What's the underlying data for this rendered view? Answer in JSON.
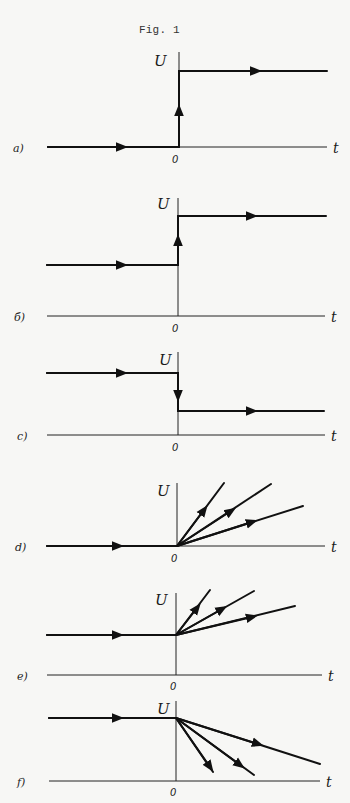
{
  "figure": {
    "title": "Fig. 1",
    "axis_labels": {
      "y": "U",
      "x": "t",
      "origin": "0"
    },
    "ink_color": "#111111",
    "paper_color": "#f7f7f5"
  },
  "panels": [
    {
      "id": "a",
      "label": "a)",
      "description": "Step up from zero: U = 0 for t < 0, jumps to a constant positive value at t = 0",
      "segments": [
        {
          "type": "line",
          "from": [
            -1,
            0
          ],
          "to": [
            0,
            0
          ],
          "arrow": "right"
        },
        {
          "type": "jump",
          "from": [
            0,
            0
          ],
          "to": [
            0,
            1
          ],
          "arrow": "up"
        },
        {
          "type": "line",
          "from": [
            0,
            1
          ],
          "to": [
            1,
            1
          ],
          "arrow": "right"
        }
      ]
    },
    {
      "id": "b",
      "label": "б)",
      "description": "Step up from a nonzero constant to a higher constant at t = 0",
      "segments": [
        {
          "type": "line",
          "from": [
            -1,
            0.5
          ],
          "to": [
            0,
            0.5
          ],
          "arrow": "right"
        },
        {
          "type": "jump",
          "from": [
            0,
            0.5
          ],
          "to": [
            0,
            1
          ],
          "arrow": "up"
        },
        {
          "type": "line",
          "from": [
            0,
            1
          ],
          "to": [
            1,
            1
          ],
          "arrow": "right"
        }
      ]
    },
    {
      "id": "c",
      "label": "c)",
      "description": "Step down from a higher constant to a lower constant at t = 0",
      "segments": [
        {
          "type": "line",
          "from": [
            -1,
            1
          ],
          "to": [
            0,
            1
          ],
          "arrow": "right"
        },
        {
          "type": "jump",
          "from": [
            0,
            1
          ],
          "to": [
            0,
            0.35
          ],
          "arrow": "down"
        },
        {
          "type": "line",
          "from": [
            0,
            0.35
          ],
          "to": [
            1,
            0.35
          ],
          "arrow": "right"
        }
      ]
    },
    {
      "id": "d",
      "label": "d)",
      "description": "U = 0 for t < 0, then linear ramps of three different positive slopes from the origin",
      "segments": [
        {
          "type": "line",
          "from": [
            -1,
            0
          ],
          "to": [
            0,
            0
          ],
          "arrow": "right"
        },
        {
          "type": "ray",
          "slope": "steep",
          "arrow": "outward"
        },
        {
          "type": "ray",
          "slope": "medium",
          "arrow": "outward"
        },
        {
          "type": "ray",
          "slope": "shallow",
          "arrow": "outward"
        }
      ]
    },
    {
      "id": "e",
      "label": "e)",
      "description": "U constant positive for t < 0, then linear increases of three different slopes",
      "segments": [
        {
          "type": "line",
          "from": [
            -1,
            0.5
          ],
          "to": [
            0,
            0.5
          ],
          "arrow": "right"
        },
        {
          "type": "ray",
          "slope": "steep",
          "arrow": "outward"
        },
        {
          "type": "ray",
          "slope": "medium",
          "arrow": "outward"
        },
        {
          "type": "ray",
          "slope": "shallow",
          "arrow": "outward"
        }
      ]
    },
    {
      "id": "f",
      "label": "f)",
      "description": "U constant positive for t < 0, then linear decreases of three different negative slopes",
      "segments": [
        {
          "type": "line",
          "from": [
            -1,
            1
          ],
          "to": [
            0,
            1
          ],
          "arrow": "right"
        },
        {
          "type": "ray",
          "slope": "steep-negative",
          "arrow": "outward"
        },
        {
          "type": "ray",
          "slope": "medium-negative",
          "arrow": "outward"
        },
        {
          "type": "ray",
          "slope": "shallow-negative",
          "arrow": "outward"
        }
      ]
    }
  ]
}
